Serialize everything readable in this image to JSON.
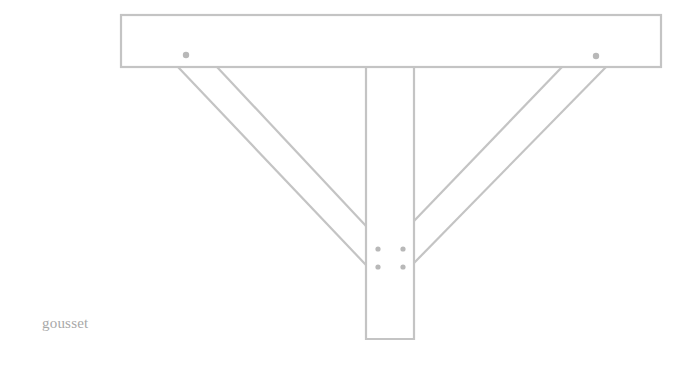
{
  "diagram": {
    "caption": "gousset",
    "stroke_color": "#c4c4c4",
    "dot_color": "#b8b8b8",
    "parts": [
      "beam",
      "post",
      "left-brace",
      "right-brace"
    ],
    "beam_dots": 2,
    "post_dots": 4
  }
}
